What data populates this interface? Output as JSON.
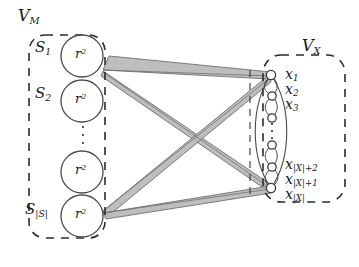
{
  "figure": {
    "type": "bipartite-graph-diagram",
    "background": "#ffffff",
    "ink_color": "#2b2b2b",
    "beam_fill": "#b9b9b9",
    "beam_stroke": "#6f6f6f"
  },
  "left_group": {
    "name": "V_M",
    "label": "V",
    "label_sub": "M",
    "boundary": "dashed-rounded-rectangle",
    "set_labels": [
      {
        "base": "S",
        "sub": "1",
        "text": "S"
      },
      {
        "base": "S",
        "sub": "2",
        "text": "S"
      },
      {
        "base": "S",
        "sub": "|S|",
        "text": "S"
      }
    ],
    "nodes": [
      {
        "id": "s1",
        "label": "r",
        "exp": "2"
      },
      {
        "id": "s2",
        "label": "r",
        "exp": "2"
      },
      {
        "id": "s3",
        "label": "r",
        "exp": "2"
      },
      {
        "id": "s4",
        "label": "r",
        "exp": "2"
      }
    ],
    "ellipsis": "vertical-dots"
  },
  "right_group": {
    "name": "V_X",
    "label": "V",
    "label_sub": "X",
    "boundary": "dashed-rounded-rectangle",
    "node_labels": [
      {
        "base": "x",
        "sub": "1"
      },
      {
        "base": "x",
        "sub": "2"
      },
      {
        "base": "x",
        "sub": "3"
      },
      {
        "base": "x",
        "sub": "|X|+2"
      },
      {
        "base": "x",
        "sub": "|X|+1"
      },
      {
        "base": "x",
        "sub": "|X|"
      }
    ],
    "node_count": 6,
    "ellipsis": "vertical-dots",
    "lens": "vertical-lens-outline"
  },
  "labels": {
    "r_squared": "r²",
    "x_prefix": "x",
    "abs_X": "|X|",
    "abs_S": "|S|",
    "S": "S",
    "V": "V"
  }
}
